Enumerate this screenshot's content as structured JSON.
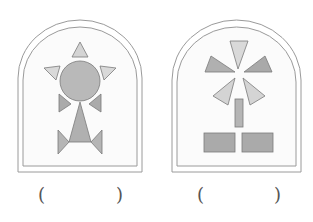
{
  "figures": [
    {
      "id": "figure-robot",
      "description": "Arched frame containing a figure made of a circle and triangles",
      "answer_blank": {
        "left": "(",
        "right": ")"
      }
    },
    {
      "id": "figure-windmill",
      "description": "Arched frame containing a windmill-like figure made of triangles and rectangles",
      "answer_blank": {
        "left": "(",
        "right": ")"
      }
    }
  ],
  "colors": {
    "frame_stroke": "#9a9a9a",
    "light_fill": "#d9d9d9",
    "mid_fill": "#b8b8b8",
    "dark_fill": "#a9a9a9",
    "shape_stroke": "#7a7a7a"
  }
}
